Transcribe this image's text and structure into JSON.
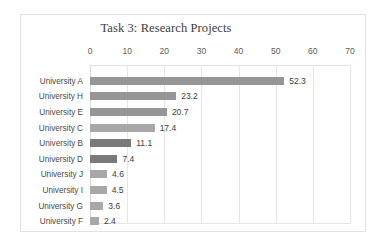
{
  "chart_data": {
    "type": "bar",
    "orientation": "horizontal",
    "title": "Task 3: Research Projects",
    "xlabel": "",
    "ylabel": "",
    "xlim": [
      0,
      70
    ],
    "xticks": [
      0,
      10,
      20,
      30,
      40,
      50,
      60,
      70
    ],
    "xtick_labels": [
      "0",
      "10",
      "20",
      "30",
      "40",
      "50",
      "60",
      "70"
    ],
    "grid": true,
    "legend": false,
    "data_labels": true,
    "categories": [
      "University A",
      "University H",
      "University E",
      "University C",
      "University B",
      "University D",
      "University J",
      "University I",
      "University G",
      "University F"
    ],
    "values": [
      52.3,
      23.2,
      20.7,
      17.4,
      11.1,
      7.4,
      4.6,
      4.5,
      3.6,
      2.4
    ],
    "value_labels": [
      "52.3",
      "23.2",
      "20.7",
      "17.4",
      "11.1",
      "7.4",
      "4.6",
      "4.5",
      "3.6",
      "2.4"
    ],
    "bar_shades": [
      "mid",
      "mid",
      "mid",
      "light",
      "dark",
      "dark",
      "light",
      "light",
      "light",
      "light"
    ],
    "colors": {
      "bar_mid": "#969696",
      "bar_dark": "#7a7a7a",
      "bar_light": "#a8a8a8",
      "grid": "#e6e6e6",
      "frame": "#e2e2e2",
      "text": "#4a4a4a",
      "background": "#ffffff"
    }
  }
}
